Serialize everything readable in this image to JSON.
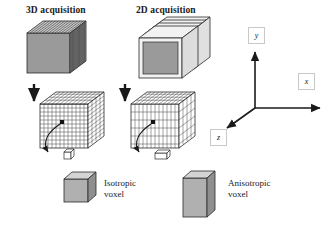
{
  "figure": {
    "type": "diagram"
  },
  "columns": {
    "left_title": "3D acquisition",
    "right_title": "2D acquisition"
  },
  "legend": {
    "isotropic": {
      "line1": "Isotropic",
      "line2": "voxel"
    },
    "anisotropic": {
      "line1": "Anisotropic",
      "line2": "voxel"
    }
  },
  "axes": {
    "x": "x",
    "y": "y",
    "z": "z"
  },
  "colors": {
    "ink": "#1a1a1a",
    "face_front": "#9a9a9a",
    "face_top": "#c8c8c8",
    "face_side": "#7d7d7d",
    "slab_white": "#f2f2f2",
    "box_border": "#c9c9c9",
    "grid_line": "#333333"
  },
  "slices": {
    "three_d_count": 14,
    "two_d_count": 4,
    "grid_fine_rows": 12,
    "grid_coarse_rows": 5
  }
}
